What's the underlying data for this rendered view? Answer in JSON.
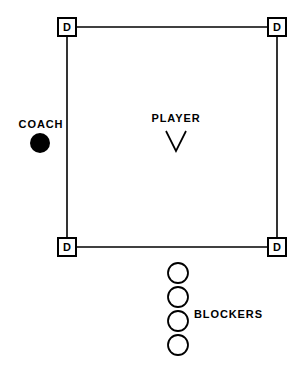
{
  "diagram": {
    "background_color": "#ffffff",
    "stroke_color": "#000000",
    "width": 303,
    "height": 377
  },
  "court": {
    "name": "court-outline",
    "shape": "square",
    "corners": [
      {
        "id": "top-left",
        "x": 67,
        "y": 27
      },
      {
        "id": "top-right",
        "x": 277,
        "y": 27
      },
      {
        "id": "bottom-right",
        "x": 277,
        "y": 247
      },
      {
        "id": "bottom-left",
        "x": 67,
        "y": 247
      }
    ]
  },
  "defenders": [
    {
      "id": "defender-top-left",
      "label": "D",
      "x": 67,
      "y": 27
    },
    {
      "id": "defender-top-right",
      "label": "D",
      "x": 277,
      "y": 27
    },
    {
      "id": "defender-bottom-left",
      "label": "D",
      "x": 67,
      "y": 247
    },
    {
      "id": "defender-bottom-right",
      "label": "D",
      "x": 277,
      "y": 247
    }
  ],
  "coach": {
    "label": "COACH",
    "label_x": 41,
    "label_y": 128,
    "marker_shape": "filled-circle",
    "marker_x": 40,
    "marker_y": 143,
    "marker_radius": 10,
    "marker_color": "#000000"
  },
  "player": {
    "label": "PLAYER",
    "label_x": 175,
    "label_y": 122,
    "marker_shape": "v-chevron",
    "marker_x": 176,
    "marker_y": 141
  },
  "blockers": {
    "label": "BLOCKERS",
    "label_x": 194,
    "label_y": 318,
    "marker_shape": "open-circle",
    "marker_radius": 10,
    "positions": [
      {
        "id": "blocker-1",
        "x": 178,
        "y": 273
      },
      {
        "id": "blocker-2",
        "x": 178,
        "y": 297
      },
      {
        "id": "blocker-3",
        "x": 178,
        "y": 321
      },
      {
        "id": "blocker-4",
        "x": 178,
        "y": 345
      }
    ]
  }
}
